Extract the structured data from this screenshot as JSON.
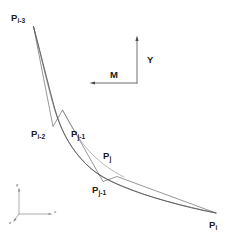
{
  "figure": {
    "name": "curve-refinement-diagram",
    "background_color": "#ffffff",
    "stroke_color": "#555555",
    "curve_color": "#3a3a3a",
    "text_color": "#1a1a1a",
    "axis_color": "#777777",
    "width": 231,
    "height": 239
  },
  "points": [
    {
      "id": "p-i-3",
      "base": "P",
      "subscript": "i-3",
      "label_x": 11,
      "label_y": 13,
      "vertex_x": 33.5,
      "vertex_y": 26.5
    },
    {
      "id": "p-i-2",
      "base": "P",
      "subscript": "i-2",
      "label_x": 31,
      "label_y": 129,
      "vertex_x": 53.0,
      "vertex_y": 126.5
    },
    {
      "id": "p-j-1",
      "base": "P",
      "subscript": "j-1",
      "label_x": 71,
      "label_y": 129,
      "vertex_x": 62.5,
      "vertex_y": 110.0
    },
    {
      "id": "p-j",
      "base": "P",
      "subscript": "j",
      "label_x": 103,
      "label_y": 151,
      "vertex_x": 117.0,
      "vertex_y": 176.5
    },
    {
      "id": "p-j-minus-1",
      "base": "P",
      "subscript": "j-1",
      "label_x": 92,
      "label_y": 185,
      "vertex_x": 103.0,
      "vertex_y": 181.5
    },
    {
      "id": "p-i",
      "base": "P",
      "subscript": "i",
      "label_x": 209,
      "label_y": 220,
      "vertex_x": 216.0,
      "vertex_y": 213.0
    }
  ],
  "directions": {
    "vertical": {
      "label": "Y",
      "label_x": 147,
      "label_y": 55,
      "arrow": {
        "x1": 137,
        "y1": 83,
        "x2": 137,
        "y2": 37
      }
    },
    "horizontal": {
      "label": "M",
      "label_x": 110,
      "label_y": 70,
      "arrow": {
        "x1": 137,
        "y1": 83,
        "x2": 90,
        "y2": 83
      }
    }
  },
  "coordinate_triad": {
    "name": "xyz-axes",
    "origin_x": 19,
    "origin_y": 214,
    "axes": [
      {
        "id": "y-axis",
        "label": "y",
        "x1": 19,
        "y1": 214,
        "x2": 19,
        "y2": 188,
        "label_x": 16,
        "label_y": 184
      },
      {
        "id": "x-axis",
        "label": "x",
        "x1": 19,
        "y1": 214,
        "x2": 52,
        "y2": 214,
        "label_x": 54,
        "label_y": 213
      },
      {
        "id": "z-axis",
        "label": "z",
        "x1": 19,
        "y1": 214,
        "x2": 13,
        "y2": 222,
        "label_x": 9,
        "label_y": 221
      }
    ]
  },
  "geometry": {
    "polyline_label": "control polygon through P points",
    "polyline_points": "33.5,26.5 53.0,126.5 62.5,110.0 103.0,181.5 117.0,176.5 216.0,213.0",
    "spline_label": "smoothed spline curve",
    "spline_path": "M 33.5 26.5 C 45 70 52 100 57 116 C 63 134 72 150 86 164 C 97 175 108 180 122 186 C 148 197 184 207 216 213",
    "spline_path_inner": "M 33.5 26.5 C 44 69 51 99 56 114 C 62 132 71 149 85 163 C 96 174 107 180 121 186 C 147 197 184 206 216 213",
    "chord_path": "M 62.5 110.0 C 72 128 80 142 92 154 C 102 164 112 171 124 177"
  }
}
